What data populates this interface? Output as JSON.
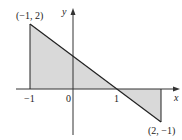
{
  "diagram": {
    "type": "function graph with shaded regions",
    "function": "y = 1 - x on [-1, 2]",
    "axes": {
      "x_label": "x",
      "y_label": "y"
    },
    "ticks": {
      "x": [
        "−1",
        "0",
        "1"
      ]
    },
    "points": [
      {
        "label": "(−1, 2)",
        "x": -1,
        "y": 2
      },
      {
        "label": "(2, −1)",
        "x": 2,
        "y": -1
      }
    ],
    "regions": [
      {
        "name": "upper-triangle",
        "from_x": -1,
        "to_x": 1,
        "above_axis": true
      },
      {
        "name": "lower-triangle",
        "from_x": 1,
        "to_x": 2,
        "above_axis": false
      }
    ],
    "colors": {
      "fill": "#d9d9d9",
      "line": "#222222",
      "axis": "#333333"
    }
  }
}
